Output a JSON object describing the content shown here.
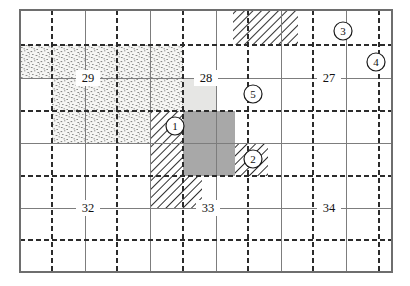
{
  "map": {
    "title": "Township survey grid map",
    "frame": {
      "x": 20,
      "y": 10,
      "width": 372,
      "height": 262
    },
    "grid": {
      "cell_size": 32.6,
      "cols": 11.4,
      "rows": 8,
      "solid_line_color": "#7a7a7a",
      "dashed_line_color": "#2b2b2b",
      "border_color": "#6e6e6e",
      "note": "solid lines = section lines, dashed lines = quarter-section lines"
    },
    "section_labels": [
      {
        "name": "section-label-29",
        "text": "29",
        "x": 88,
        "y": 78
      },
      {
        "name": "section-label-28",
        "text": "28",
        "x": 206,
        "y": 78
      },
      {
        "name": "section-label-27",
        "text": "27",
        "x": 329,
        "y": 78
      },
      {
        "name": "section-label-32",
        "text": "32",
        "x": 88,
        "y": 208
      },
      {
        "name": "section-label-33",
        "text": "33",
        "x": 208,
        "y": 208
      },
      {
        "name": "section-label-34",
        "text": "34",
        "x": 329,
        "y": 208
      }
    ],
    "callouts": [
      {
        "name": "callout-1",
        "text": "1",
        "cx": 175,
        "cy": 126,
        "r": 9
      },
      {
        "name": "callout-2",
        "text": "2",
        "cx": 253,
        "cy": 159,
        "r": 9
      },
      {
        "name": "callout-3",
        "text": "3",
        "cx": 343,
        "cy": 31,
        "r": 9
      },
      {
        "name": "callout-4",
        "text": "4",
        "cx": 376,
        "cy": 62,
        "r": 9
      },
      {
        "name": "callout-5",
        "text": "5",
        "cx": 253,
        "cy": 94,
        "r": 9
      }
    ],
    "parcels": [
      {
        "name": "parcel-stipple-north",
        "fill": "stipple",
        "x": 20,
        "y": 45,
        "width": 163,
        "height": 33
      },
      {
        "name": "parcel-stipple-south",
        "fill": "stipple",
        "x": 52,
        "y": 78,
        "width": 131,
        "height": 33
      },
      {
        "name": "parcel-stipple-lower-left",
        "fill": "stipple",
        "x": 52,
        "y": 111,
        "width": 65,
        "height": 32
      },
      {
        "name": "parcel-stipple-lower-mid",
        "fill": "stipple",
        "x": 117,
        "y": 111,
        "width": 33,
        "height": 32
      },
      {
        "name": "parcel-lightgrey-upper",
        "fill": "lightgrey",
        "x": 183,
        "y": 78,
        "width": 33,
        "height": 33
      },
      {
        "name": "parcel-darkgrey-block",
        "fill": "darkgrey",
        "x": 183,
        "y": 111,
        "width": 52,
        "height": 65
      },
      {
        "name": "parcel-hatch-top",
        "fill": "hatch",
        "x": 233,
        "y": 10,
        "width": 65,
        "height": 35
      },
      {
        "name": "parcel-hatch-left-of-1",
        "fill": "hatch",
        "x": 150,
        "y": 111,
        "width": 33,
        "height": 65
      },
      {
        "name": "parcel-hatch-below",
        "fill": "hatch",
        "x": 150,
        "y": 176,
        "width": 52,
        "height": 32
      },
      {
        "name": "parcel-hatch-near-2",
        "fill": "hatch",
        "x": 235,
        "y": 143,
        "width": 33,
        "height": 33
      }
    ],
    "legend": {
      "stipple_label": "stippled parcel",
      "lightgrey_label": "light shaded parcel",
      "darkgrey_label": "dark shaded parcel",
      "hatch_label": "hatched parcel"
    },
    "colors": {
      "stipple": "#f2f2f0",
      "lightgrey": "#e4e4e2",
      "darkgrey": "#a8a8a8",
      "hatch_line": "#2f2f2f",
      "label_text": "#111111"
    }
  }
}
